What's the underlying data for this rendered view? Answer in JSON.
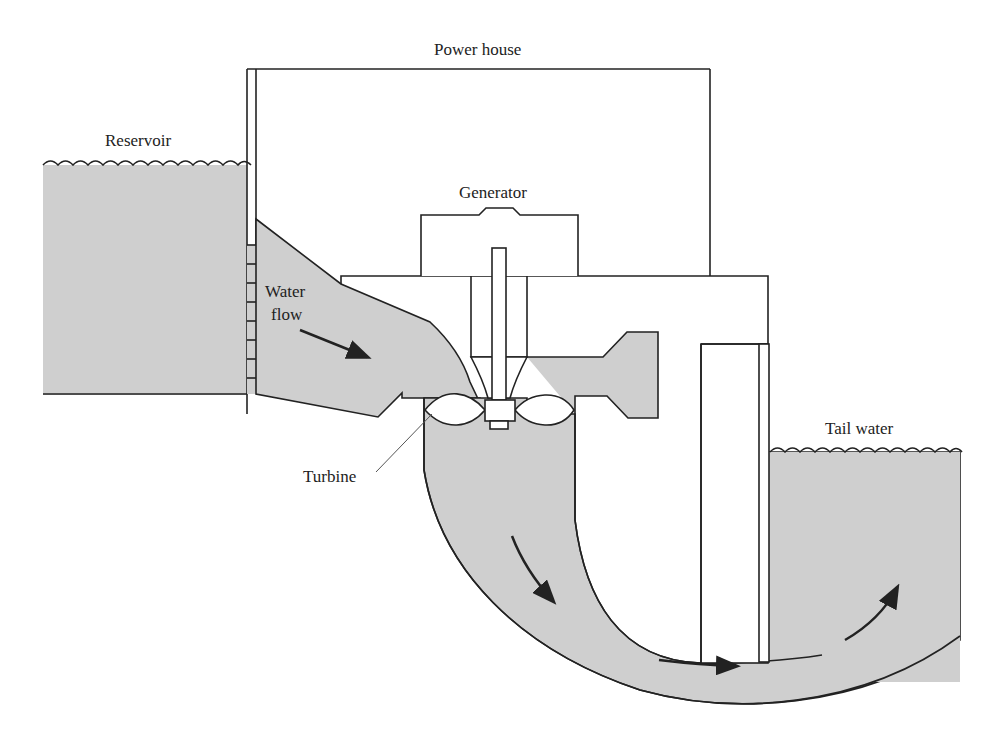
{
  "diagram": {
    "labels": {
      "power_house": "Power house",
      "reservoir": "Reservoir",
      "generator": "Generator",
      "water_flow_line1": "Water",
      "water_flow_line2": "flow",
      "turbine": "Turbine",
      "tail_water": "Tail water"
    },
    "colors": {
      "water": "#cfcfcf",
      "line": "#222222",
      "background": "#ffffff"
    },
    "flow_arrows": 5
  }
}
